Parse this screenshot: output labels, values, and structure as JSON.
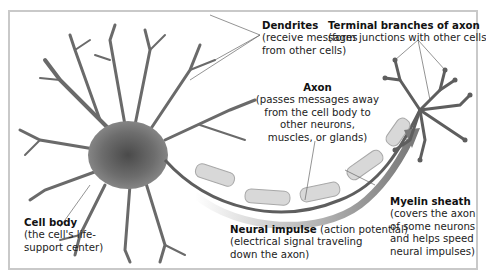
{
  "diagram": {
    "labels": {
      "dendrites": {
        "title": "Dendrites",
        "lines": [
          "(receive messages",
          "from other cells)"
        ]
      },
      "terminal": {
        "title": "Terminal branches of axon",
        "lines": [
          "(form junctions with other cells)"
        ]
      },
      "axon": {
        "title": "Axon",
        "lines": [
          "(passes messages away",
          "from the cell body to",
          "other neurons,",
          "muscles, or glands)"
        ]
      },
      "cell_body": {
        "title": "Cell body",
        "lines": [
          "(the cell's life-",
          "support center)"
        ]
      },
      "impulse": {
        "title": "Neural impulse",
        "title_suffix": " (action potential)",
        "lines": [
          "(electrical signal traveling",
          "down the axon)"
        ]
      },
      "myelin": {
        "title": "Myelin sheath",
        "lines": [
          "(covers the axon",
          "of some neurons",
          "and helps speed",
          "neural impulses)"
        ]
      }
    },
    "colors": {
      "frame": "#c9c9c9",
      "neuron": "#5e5e5e",
      "myelin": "#d8d8d8",
      "arrow": "#8a8a8a",
      "leader": "#666666"
    }
  }
}
